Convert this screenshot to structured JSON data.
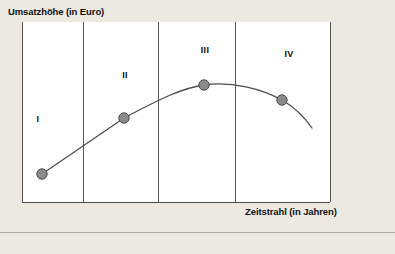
{
  "figure": {
    "name": "produktlebenszyklus-diagram",
    "background_color": "#ece9e3",
    "plot_background_color": "#ffffff",
    "axis_color": "#4a4a4a",
    "divider_color": "#555555",
    "curve_color": "#4d4d4d",
    "marker_fill": "#8a8a8a",
    "marker_stroke": "#4a4a4a",
    "separator_color": "#aaaaaa"
  },
  "axes": {
    "y_title": "Umsatzhöhe (in Euro)",
    "x_title": "Zeitstrahl (in Jahren)"
  },
  "phases": [
    {
      "label": "I"
    },
    {
      "label": "II"
    },
    {
      "label": "III"
    },
    {
      "label": "IV"
    }
  ],
  "chart_data": {
    "type": "line",
    "title": "",
    "subtitle": "",
    "xlabel": "Zeitstrahl (in Jahren)",
    "ylabel": "Umsatzhöhe (in Euro)",
    "grid": false,
    "legend": "none",
    "xlim": [
      0,
      1
    ],
    "ylim": [
      0,
      1
    ],
    "series": [
      {
        "name": "Umsatzverlauf",
        "marker_points_px": [
          {
            "phase": "I",
            "x": 42,
            "y": 174
          },
          {
            "phase": "II",
            "x": 124,
            "y": 118
          },
          {
            "phase": "III",
            "x": 204,
            "y": 85
          },
          {
            "phase": "IV",
            "x": 282,
            "y": 100
          }
        ],
        "normalized_points": [
          {
            "phase": "I",
            "x": 0.06,
            "y": 0.16
          },
          {
            "phase": "II",
            "x": 0.33,
            "y": 0.47
          },
          {
            "phase": "III",
            "x": 0.59,
            "y": 0.65
          },
          {
            "phase": "IV",
            "x": 0.84,
            "y": 0.57
          }
        ]
      }
    ],
    "phase_dividers_px": [
      22,
      83,
      158,
      235,
      330
    ],
    "plot_rect_px": {
      "x0": 22,
      "y0": 22,
      "x1": 330,
      "y1": 202
    },
    "curve_path": "M 42 174 L 124 118 C 160 99 182 88 204 85 C 232 81 262 89 282 100 C 296 108 305 118 312 128",
    "annotations": [
      {
        "text": "I",
        "x": 38,
        "y": 119
      },
      {
        "text": "II",
        "x": 125,
        "y": 75
      },
      {
        "text": "III",
        "x": 205,
        "y": 50
      },
      {
        "text": "IV",
        "x": 289,
        "y": 54
      }
    ]
  }
}
